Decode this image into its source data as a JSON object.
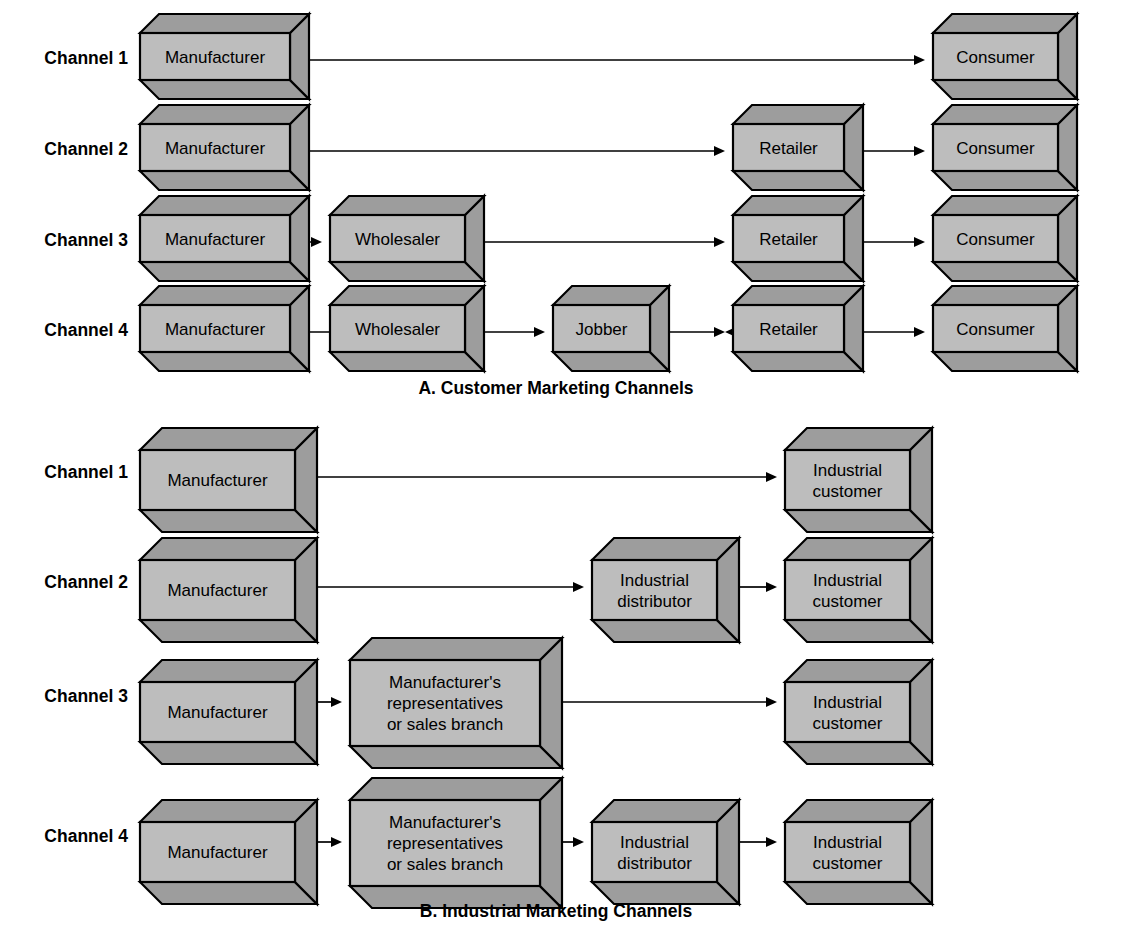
{
  "figure": {
    "background_color": "#ffffff",
    "box_front_color": "#bdbdbd",
    "box_shade_color": "#9d9d9d",
    "box_outline_color": "#000000",
    "arrow_color": "#000000"
  },
  "sections": [
    {
      "id": "section-a",
      "caption": "A. Customer Marketing Channels",
      "caption_x": 556,
      "caption_y": 394,
      "rows": [
        {
          "label": "Channel 1",
          "label_x": 128,
          "label_y": 64,
          "top": 33,
          "height": 47,
          "depth": 19,
          "nodes": [
            {
              "text": [
                "Manufacturer"
              ],
              "x": 140,
              "w": 150
            },
            {
              "text": [
                "Consumer"
              ],
              "x": 933,
              "w": 125
            }
          ],
          "arrows": [
            {
              "x1": 309,
              "x2": 925,
              "y": 60
            }
          ]
        },
        {
          "label": "Channel 2",
          "label_x": 128,
          "label_y": 155,
          "top": 124,
          "height": 47,
          "depth": 19,
          "nodes": [
            {
              "text": [
                "Manufacturer"
              ],
              "x": 140,
              "w": 150
            },
            {
              "text": [
                "Retailer"
              ],
              "x": 733,
              "w": 111
            },
            {
              "text": [
                "Consumer"
              ],
              "x": 933,
              "w": 125
            }
          ],
          "arrows": [
            {
              "x1": 309,
              "x2": 725,
              "y": 151
            },
            {
              "x1": 863,
              "x2": 925,
              "y": 151
            }
          ]
        },
        {
          "label": "Channel 3",
          "label_x": 128,
          "label_y": 246,
          "top": 215,
          "height": 47,
          "depth": 19,
          "nodes": [
            {
              "text": [
                "Manufacturer"
              ],
              "x": 140,
              "w": 150
            },
            {
              "text": [
                "Wholesaler"
              ],
              "x": 330,
              "w": 135
            },
            {
              "text": [
                "Retailer"
              ],
              "x": 733,
              "w": 111
            },
            {
              "text": [
                "Consumer"
              ],
              "x": 933,
              "w": 125
            }
          ],
          "arrows": [
            {
              "x1": 309,
              "x2": 322,
              "y": 242
            },
            {
              "x1": 484,
              "x2": 725,
              "y": 242
            },
            {
              "x1": 863,
              "x2": 925,
              "y": 242
            }
          ]
        },
        {
          "label": "Channel 4",
          "label_x": 128,
          "label_y": 336,
          "top": 305,
          "height": 47,
          "depth": 19,
          "nodes": [
            {
              "text": [
                "Manufacturer"
              ],
              "x": 140,
              "w": 150
            },
            {
              "text": [
                "Wholesaler"
              ],
              "x": 330,
              "w": 135
            },
            {
              "text": [
                "Jobber"
              ],
              "x": 553,
              "w": 97
            },
            {
              "text": [
                "Retailer"
              ],
              "x": 733,
              "w": 111
            },
            {
              "text": [
                "Consumer"
              ],
              "x": 933,
              "w": 125
            }
          ],
          "arrows": [
            {
              "x1": 309,
              "x2": 545,
              "y": 332
            },
            {
              "x1": 669,
              "x2": 725,
              "y": 332
            },
            {
              "x1": 863,
              "x2": 725,
              "y": 332
            },
            {
              "x1": 863,
              "x2": 925,
              "y": 332
            }
          ]
        }
      ]
    },
    {
      "id": "section-b",
      "caption": "B. Industrial Marketing Channels",
      "caption_x": 556,
      "caption_y": 917,
      "rows": [
        {
          "label": "Channel 1",
          "label_x": 128,
          "label_y": 478,
          "top": 450,
          "height": 60,
          "depth": 22,
          "nodes": [
            {
              "text": [
                "Manufacturer"
              ],
              "x": 140,
              "w": 155
            },
            {
              "text": [
                "Industrial",
                "customer"
              ],
              "x": 785,
              "w": 125
            }
          ],
          "arrows": [
            {
              "x1": 318,
              "x2": 777,
              "y": 477
            }
          ]
        },
        {
          "label": "Channel 2",
          "label_x": 128,
          "label_y": 588,
          "top": 560,
          "height": 60,
          "depth": 22,
          "nodes": [
            {
              "text": [
                "Manufacturer"
              ],
              "x": 140,
              "w": 155
            },
            {
              "text": [
                "Industrial",
                "distributor"
              ],
              "x": 592,
              "w": 125
            },
            {
              "text": [
                "Industrial",
                "customer"
              ],
              "x": 785,
              "w": 125
            }
          ],
          "arrows": [
            {
              "x1": 318,
              "x2": 584,
              "y": 587
            },
            {
              "x1": 740,
              "x2": 777,
              "y": 587
            }
          ]
        },
        {
          "label": "Channel 3",
          "label_x": 128,
          "label_y": 702,
          "top": 660,
          "height": 86,
          "depth": 22,
          "nodes": [
            {
              "text": [
                "Manufacturer"
              ],
              "x": 140,
              "w": 155,
              "h": 60,
              "top_offset": 22
            },
            {
              "text": [
                "Manufacturer's",
                "representatives",
                "or sales branch"
              ],
              "x": 350,
              "w": 190
            },
            {
              "text": [
                "Industrial",
                "customer"
              ],
              "x": 785,
              "w": 125,
              "h": 60,
              "top_offset": 22
            }
          ],
          "arrows": [
            {
              "x1": 318,
              "x2": 342,
              "y": 702
            },
            {
              "x1": 562,
              "x2": 777,
              "y": 702
            }
          ]
        },
        {
          "label": "Channel 4",
          "label_x": 128,
          "label_y": 842,
          "top": 800,
          "height": 86,
          "depth": 22,
          "nodes": [
            {
              "text": [
                "Manufacturer"
              ],
              "x": 140,
              "w": 155,
              "h": 60,
              "top_offset": 22
            },
            {
              "text": [
                "Manufacturer's",
                "representatives",
                "or sales branch"
              ],
              "x": 350,
              "w": 190
            },
            {
              "text": [
                "Industrial",
                "distributor"
              ],
              "x": 592,
              "w": 125,
              "h": 60,
              "top_offset": 22
            },
            {
              "text": [
                "Industrial",
                "customer"
              ],
              "x": 785,
              "w": 125,
              "h": 60,
              "top_offset": 22
            }
          ],
          "arrows": [
            {
              "x1": 318,
              "x2": 342,
              "y": 842
            },
            {
              "x1": 562,
              "x2": 584,
              "y": 842
            },
            {
              "x1": 740,
              "x2": 777,
              "y": 842
            }
          ]
        }
      ]
    }
  ]
}
